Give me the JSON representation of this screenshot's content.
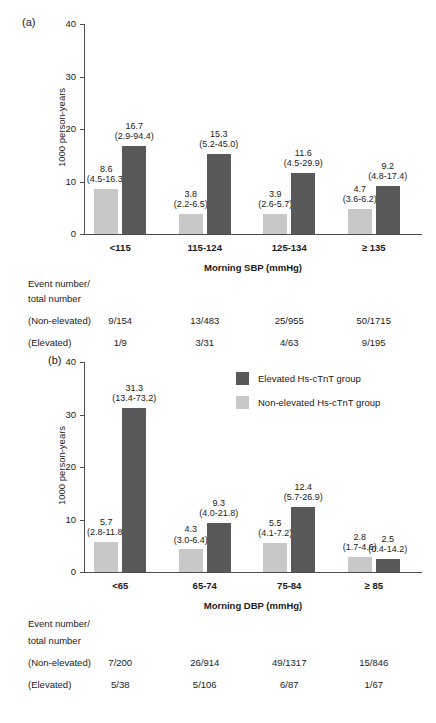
{
  "figure": {
    "panel_a_letter": "(a)",
    "panel_b_letter": "(b)"
  },
  "legend": {
    "items": [
      {
        "label": "Elevated Hs-cTnT group",
        "swatch": "dark",
        "color": "#595959"
      },
      {
        "label": "Non-elevated Hs-cTnT group",
        "swatch": "light",
        "color": "#c8c8c8"
      }
    ]
  },
  "event_table_labels": {
    "header_line1": "Event number/",
    "header_line2": "total number",
    "row_non_elevated": "(Non-elevated)",
    "row_elevated": "(Elevated)"
  },
  "chart_data": [
    {
      "type": "bar",
      "panel": "(a)",
      "title": "",
      "xlabel": "Morning SBP (mmHg)",
      "ylabel": "1000 person-years",
      "ylim": [
        0,
        40
      ],
      "yticks": [
        0,
        10,
        20,
        30,
        40
      ],
      "grid": false,
      "legend_position": "none",
      "categories": [
        "<115",
        "115-124",
        "125-134",
        "≥ 135"
      ],
      "series": [
        {
          "name": "Non-elevated Hs-cTnT group",
          "color": "#c8c8c8",
          "values": [
            8.6,
            3.8,
            3.9,
            4.7
          ],
          "labels": [
            "8.6",
            "3.8",
            "3.9",
            "4.7"
          ],
          "ci_labels": [
            "(4.5-16.3)",
            "(2.2-6.5)",
            "(2.6-5.7)",
            "(3.6-6.2)"
          ],
          "events": [
            "9/154",
            "13/483",
            "25/955",
            "50/1715"
          ]
        },
        {
          "name": "Elevated Hs-cTnT group",
          "color": "#595959",
          "values": [
            16.7,
            15.3,
            11.6,
            9.2
          ],
          "labels": [
            "16.7",
            "15.3",
            "11.6",
            "9.2"
          ],
          "ci_labels": [
            "(2.9-94.4)",
            "(5.2-45.0)",
            "(4.5-29.9)",
            "(4.8-17.4)"
          ],
          "events": [
            "1/9",
            "3/31",
            "4/63",
            "9/195"
          ]
        }
      ]
    },
    {
      "type": "bar",
      "panel": "(b)",
      "title": "",
      "xlabel": "Morning DBP (mmHg)",
      "ylabel": "1000 person-years",
      "ylim": [
        0,
        40
      ],
      "yticks": [
        0,
        10,
        20,
        30,
        40
      ],
      "grid": false,
      "legend_position": "top-right-inside",
      "categories": [
        "<65",
        "65-74",
        "75-84",
        "≥ 85"
      ],
      "series": [
        {
          "name": "Non-elevated Hs-cTnT group",
          "color": "#c8c8c8",
          "values": [
            5.7,
            4.3,
            5.5,
            2.8
          ],
          "labels": [
            "5.7",
            "4.3",
            "5.5",
            "2.8"
          ],
          "ci_labels": [
            "(2.8-11.8)",
            "(3.0-6.4)",
            "(4.1-7.2)",
            "(1.7-4.6)"
          ],
          "events": [
            "7/200",
            "26/914",
            "49/1317",
            "15/846"
          ]
        },
        {
          "name": "Elevated Hs-cTnT group",
          "color": "#595959",
          "values": [
            31.3,
            9.3,
            12.4,
            2.5
          ],
          "labels": [
            "31.3",
            "9.3",
            "12.4",
            "2.5"
          ],
          "ci_labels": [
            "(13.4-73.2)",
            "(4.0-21.8)",
            "(5.7-26.9)",
            "(0.4-14.2)"
          ],
          "events": [
            "5/38",
            "5/106",
            "6/87",
            "1/67"
          ]
        }
      ]
    }
  ]
}
